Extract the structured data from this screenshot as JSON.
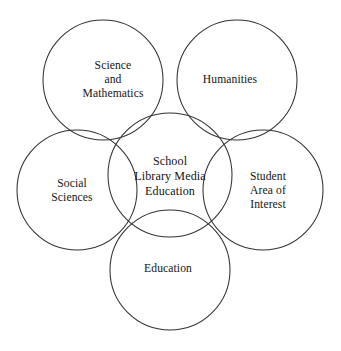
{
  "diagram": {
    "type": "venn",
    "title": "School Library Media Education",
    "background_color": "#ffffff",
    "stroke_color": "#33322f",
    "text_color": "#16150f",
    "canvas": {
      "width": 341,
      "height": 351
    },
    "center_node": {
      "id": "school-library-media-education",
      "label": "School\nLibrary Media\nEducation",
      "cx": 170,
      "cy": 175,
      "r": 62,
      "label_x": 170,
      "label_y": 176
    },
    "outer_nodes": [
      {
        "id": "science-and-mathematics",
        "label": "Science\nand\nMathematics",
        "cx": 103,
        "cy": 80,
        "r": 60,
        "label_x": 113,
        "label_y": 80
      },
      {
        "id": "humanities",
        "label": "Humanities",
        "cx": 237,
        "cy": 80,
        "r": 60,
        "label_x": 230,
        "label_y": 80
      },
      {
        "id": "social-sciences",
        "label": "Social\nSciences",
        "cx": 77,
        "cy": 190,
        "r": 60,
        "label_x": 72,
        "label_y": 191
      },
      {
        "id": "student-area-of-interest",
        "label": "Student\nArea of\nInterest",
        "cx": 263,
        "cy": 190,
        "r": 60,
        "label_x": 268,
        "label_y": 191
      },
      {
        "id": "education",
        "label": "Education",
        "cx": 170,
        "cy": 270,
        "r": 60,
        "label_x": 168,
        "label_y": 269
      }
    ]
  }
}
